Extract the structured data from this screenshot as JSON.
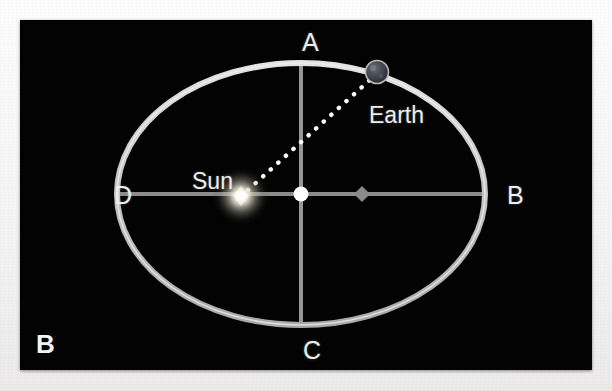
{
  "figure": {
    "panel_letter": "B",
    "caption_kind": "orbit-diagram",
    "background_color": "#030303",
    "frame_color": "#f4f4f4"
  },
  "labels": {
    "vertex_a": "A",
    "vertex_b": "B",
    "vertex_c": "C",
    "vertex_d": "D",
    "sun": "Sun",
    "earth": "Earth"
  },
  "diagram": {
    "ellipse": {
      "center_x": 281,
      "center_y": 174,
      "semi_major_axis": 184,
      "semi_minor_axis": 131,
      "stroke_color": "#c9c9c9",
      "stroke_width": 5
    },
    "axes": {
      "major_axis_color": "#8f8f8f",
      "minor_axis_color": "#9a9a9a",
      "major_axis_label_left": "D",
      "major_axis_label_right": "B",
      "minor_axis_label_top": "A",
      "minor_axis_label_bottom": "C"
    },
    "center_marker": {
      "x": 281,
      "y": 174,
      "radius": 7,
      "color": "#ffffff"
    },
    "empty_focus_marker": {
      "x": 342,
      "y": 174,
      "size": 7,
      "color": "#8a8a8a",
      "shape": "diamond"
    },
    "sun": {
      "x": 221,
      "y": 176,
      "glow_radius": 28,
      "core_color": "#ffffff",
      "glow_color": "#fff6d8"
    },
    "earth": {
      "x": 357,
      "y": 52,
      "radius": 11,
      "body_color": "#3b3f45",
      "rim_color": "#b9b9b9"
    },
    "sight_line": {
      "from": "Sun",
      "to": "Earth",
      "style": "dotted",
      "color": "#ffffff",
      "dot_radius": 2.3
    }
  }
}
